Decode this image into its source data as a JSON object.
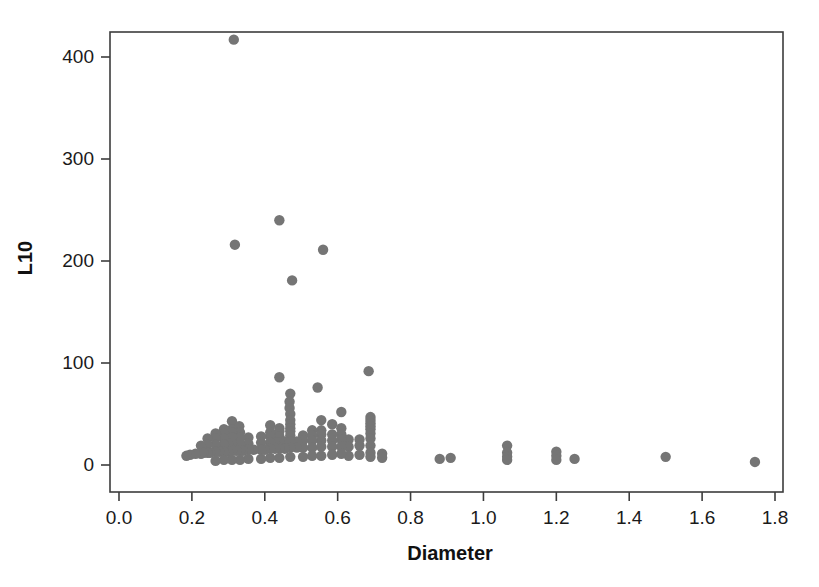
{
  "chart_data": {
    "type": "scatter",
    "title": "",
    "xlabel": "Diameter",
    "ylabel": "L10",
    "xlim": [
      -0.05,
      1.85
    ],
    "ylim": [
      -12,
      430
    ],
    "grid": false,
    "legend": null,
    "marker": {
      "shape": "circle",
      "color": "#757575",
      "radius_px": 5.2
    },
    "xticks": [
      "0.0",
      "0.2",
      "0.4",
      "0.6",
      "0.8",
      "1.0",
      "1.2",
      "1.4",
      "1.6",
      "1.8"
    ],
    "xtick_values": [
      0.0,
      0.2,
      0.4,
      0.6,
      0.8,
      1.0,
      1.2,
      1.4,
      1.6,
      1.8
    ],
    "yticks": [
      "0",
      "100",
      "200",
      "300",
      "400"
    ],
    "ytick_values": [
      0,
      100,
      200,
      300,
      400
    ],
    "n_points": 139,
    "points": [
      [
        0.315,
        417
      ],
      [
        0.44,
        240
      ],
      [
        0.318,
        216
      ],
      [
        0.56,
        211
      ],
      [
        0.475,
        181
      ],
      [
        0.685,
        92
      ],
      [
        0.44,
        86
      ],
      [
        0.545,
        76
      ],
      [
        0.47,
        70
      ],
      [
        0.468,
        62
      ],
      [
        0.468,
        56
      ],
      [
        0.61,
        52
      ],
      [
        0.47,
        50
      ],
      [
        0.69,
        47
      ],
      [
        0.69,
        44
      ],
      [
        0.555,
        44
      ],
      [
        0.47,
        44
      ],
      [
        0.31,
        43
      ],
      [
        0.69,
        41
      ],
      [
        0.585,
        40
      ],
      [
        0.47,
        40
      ],
      [
        0.415,
        39
      ],
      [
        0.33,
        38
      ],
      [
        0.69,
        38
      ],
      [
        0.61,
        36
      ],
      [
        0.47,
        36
      ],
      [
        0.44,
        36
      ],
      [
        0.31,
        35
      ],
      [
        0.288,
        35
      ],
      [
        0.69,
        35
      ],
      [
        0.555,
        34
      ],
      [
        0.53,
        34
      ],
      [
        0.47,
        33
      ],
      [
        0.44,
        33
      ],
      [
        0.415,
        32
      ],
      [
        0.332,
        32
      ],
      [
        0.31,
        32
      ],
      [
        0.288,
        31
      ],
      [
        0.265,
        31
      ],
      [
        0.69,
        31
      ],
      [
        0.61,
        30
      ],
      [
        0.585,
        30
      ],
      [
        0.555,
        30
      ],
      [
        0.53,
        29
      ],
      [
        0.505,
        29
      ],
      [
        0.47,
        29
      ],
      [
        0.44,
        28
      ],
      [
        0.415,
        28
      ],
      [
        0.39,
        28
      ],
      [
        0.355,
        27
      ],
      [
        0.332,
        27
      ],
      [
        0.31,
        27
      ],
      [
        0.288,
        26
      ],
      [
        0.265,
        26
      ],
      [
        0.243,
        26
      ],
      [
        0.69,
        26
      ],
      [
        0.66,
        25
      ],
      [
        0.63,
        25
      ],
      [
        0.61,
        25
      ],
      [
        0.585,
        24
      ],
      [
        0.555,
        24
      ],
      [
        0.53,
        24
      ],
      [
        0.505,
        24
      ],
      [
        0.488,
        23
      ],
      [
        0.47,
        23
      ],
      [
        0.455,
        23
      ],
      [
        0.44,
        22
      ],
      [
        0.428,
        22
      ],
      [
        0.415,
        22
      ],
      [
        0.39,
        22
      ],
      [
        0.355,
        21
      ],
      [
        0.332,
        21
      ],
      [
        0.31,
        21
      ],
      [
        0.3,
        21
      ],
      [
        0.288,
        20
      ],
      [
        0.265,
        20
      ],
      [
        0.243,
        20
      ],
      [
        0.225,
        19
      ],
      [
        0.69,
        19
      ],
      [
        0.66,
        19
      ],
      [
        0.63,
        18
      ],
      [
        0.61,
        18
      ],
      [
        0.585,
        18
      ],
      [
        0.555,
        18
      ],
      [
        0.53,
        17
      ],
      [
        0.505,
        17
      ],
      [
        0.488,
        17
      ],
      [
        0.47,
        17
      ],
      [
        0.455,
        16
      ],
      [
        0.44,
        16
      ],
      [
        0.428,
        16
      ],
      [
        0.415,
        16
      ],
      [
        0.4,
        15
      ],
      [
        0.39,
        15
      ],
      [
        0.37,
        15
      ],
      [
        0.355,
        15
      ],
      [
        0.34,
        14
      ],
      [
        0.332,
        14
      ],
      [
        0.322,
        14
      ],
      [
        0.31,
        14
      ],
      [
        0.3,
        13
      ],
      [
        0.288,
        13
      ],
      [
        0.275,
        13
      ],
      [
        0.265,
        13
      ],
      [
        0.25,
        12
      ],
      [
        0.243,
        12
      ],
      [
        0.232,
        12
      ],
      [
        0.225,
        11
      ],
      [
        0.21,
        11
      ],
      [
        0.195,
        10
      ],
      [
        0.185,
        9
      ],
      [
        1.065,
        19
      ],
      [
        1.065,
        12
      ],
      [
        1.065,
        8
      ],
      [
        1.065,
        5
      ],
      [
        1.2,
        13
      ],
      [
        1.2,
        9
      ],
      [
        1.2,
        5
      ],
      [
        1.25,
        6
      ],
      [
        0.88,
        6
      ],
      [
        0.91,
        7
      ],
      [
        1.5,
        8
      ],
      [
        1.745,
        3
      ],
      [
        0.69,
        12
      ],
      [
        0.69,
        8
      ],
      [
        0.66,
        10
      ],
      [
        0.63,
        9
      ],
      [
        0.722,
        11
      ],
      [
        0.722,
        7
      ],
      [
        0.61,
        11
      ],
      [
        0.585,
        10
      ],
      [
        0.555,
        9
      ],
      [
        0.53,
        9
      ],
      [
        0.505,
        8
      ],
      [
        0.47,
        8
      ],
      [
        0.44,
        7
      ],
      [
        0.415,
        7
      ],
      [
        0.39,
        6
      ],
      [
        0.355,
        6
      ],
      [
        0.332,
        5
      ],
      [
        0.31,
        5
      ],
      [
        0.288,
        5
      ],
      [
        0.265,
        4
      ]
    ]
  },
  "axes": {
    "x_title": "Diameter",
    "y_title": "L10"
  }
}
